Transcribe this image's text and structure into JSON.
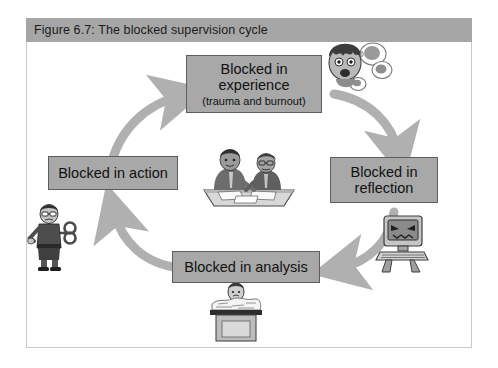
{
  "figure": {
    "title": "Figure 6.7: The blocked supervision cycle",
    "frame_border_color": "#c9c9c9",
    "title_bar_color": "#a6a6a6",
    "box_fill_color": "#a8a8a8",
    "box_border_color": "#5d5d5d",
    "arrow_color": "#b0b0b0",
    "background_color": "#ffffff"
  },
  "nodes": [
    {
      "id": "experience",
      "label": "Blocked in",
      "label_line2": "experience",
      "sublabel": "(trauma and burnout)",
      "position": "top"
    },
    {
      "id": "reflection",
      "label": "Blocked in",
      "label_line2": "reflection",
      "sublabel": "",
      "position": "right"
    },
    {
      "id": "analysis",
      "label": "Blocked in analysis",
      "label_line2": "",
      "sublabel": "",
      "position": "bottom"
    },
    {
      "id": "action",
      "label": "Blocked in action",
      "label_line2": "",
      "sublabel": "",
      "position": "left"
    }
  ],
  "arrows": [
    {
      "id": "action-to-experience",
      "from": "action",
      "to": "experience",
      "direction": "clockwise"
    },
    {
      "id": "experience-to-reflection",
      "from": "experience",
      "to": "reflection",
      "direction": "clockwise"
    },
    {
      "id": "reflection-to-analysis",
      "from": "reflection",
      "to": "analysis",
      "direction": "clockwise"
    },
    {
      "id": "analysis-to-action",
      "from": "analysis",
      "to": "action",
      "direction": "clockwise"
    }
  ],
  "illustrations": [
    {
      "id": "center",
      "name": "two-people-at-table-illustration",
      "description": "Two supervisors sitting at a table with papers"
    },
    {
      "id": "stress",
      "name": "stressed-face-illustration",
      "description": "Distressed face with thought bubbles"
    },
    {
      "id": "computer",
      "name": "angry-computer-illustration",
      "description": "Computer monitor with an angry face"
    },
    {
      "id": "paperwork",
      "name": "buried-in-paperwork-illustration",
      "description": "Person at a desk buried under piles of paper"
    },
    {
      "id": "windup",
      "name": "wind-up-person-illustration",
      "description": "Person with a wind-up key in their back"
    }
  ]
}
